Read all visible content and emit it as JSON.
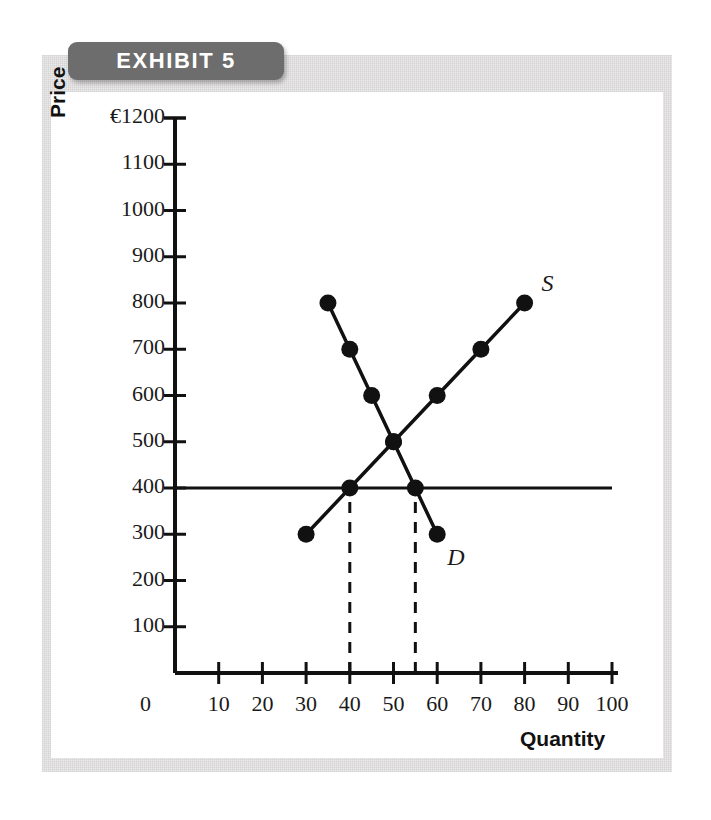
{
  "exhibit": {
    "badge_label": "EXHIBIT 5"
  },
  "chart_data": {
    "type": "line",
    "title": "EXHIBIT 5",
    "xlabel": "Quantity",
    "ylabel": "Price",
    "currency_symbol": "€",
    "xlim": [
      0,
      100
    ],
    "ylim": [
      0,
      1200
    ],
    "grid": false,
    "legend": "inline-curve-labels",
    "x_ticks": [
      10,
      20,
      30,
      40,
      50,
      60,
      70,
      80,
      90,
      100
    ],
    "x_tick_labels": [
      "10",
      "20",
      "30",
      "40",
      "50",
      "60",
      "70",
      "80",
      "90",
      "100"
    ],
    "origin_label": "0",
    "y_ticks": [
      100,
      200,
      300,
      400,
      500,
      600,
      700,
      800,
      900,
      1000,
      1100,
      1200
    ],
    "y_tick_labels": [
      "100",
      "200",
      "300",
      "400",
      "500",
      "600",
      "700",
      "800",
      "900",
      "1000",
      "1100",
      "€1200"
    ],
    "series": [
      {
        "name": "S",
        "label": "S",
        "description": "Supply curve, upward sloping",
        "points": [
          {
            "x": 30,
            "y": 300
          },
          {
            "x": 40,
            "y": 400
          },
          {
            "x": 50,
            "y": 500
          },
          {
            "x": 60,
            "y": 600
          },
          {
            "x": 70,
            "y": 700
          },
          {
            "x": 80,
            "y": 800
          }
        ]
      },
      {
        "name": "D",
        "label": "D",
        "description": "Demand curve, downward sloping",
        "points": [
          {
            "x": 35,
            "y": 800
          },
          {
            "x": 40,
            "y": 700
          },
          {
            "x": 45,
            "y": 600
          },
          {
            "x": 50,
            "y": 500
          },
          {
            "x": 55,
            "y": 400
          },
          {
            "x": 60,
            "y": 300
          }
        ]
      }
    ],
    "annotations": [
      {
        "type": "horizontal-line",
        "name": "price-line-400",
        "y": 400,
        "x_from": 0,
        "x_to": 100
      },
      {
        "type": "dashed-vertical",
        "name": "quantity-supplied-dashed",
        "x": 40,
        "y_from": 0,
        "y_to": 400
      },
      {
        "type": "dashed-vertical",
        "name": "quantity-demanded-dashed",
        "x": 55,
        "y_from": 0,
        "y_to": 400
      }
    ],
    "equilibrium": {
      "x": 50,
      "y": 500
    }
  }
}
